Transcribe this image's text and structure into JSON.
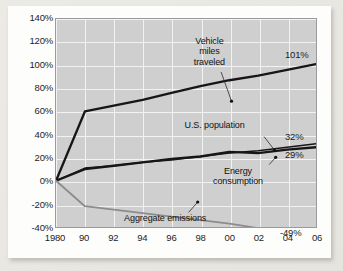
{
  "chart_data": {
    "type": "line",
    "title": "",
    "subtitle": "",
    "xlabel": "",
    "ylabel": "",
    "grid": true,
    "legend_position": "inline-annotations",
    "xlim": [
      1980,
      2006
    ],
    "ylim": [
      -40,
      140
    ],
    "ytick_step": 20,
    "x": [
      1980,
      1990,
      1992,
      1994,
      1996,
      1998,
      2000,
      2002,
      2004,
      2006
    ],
    "xtick_labels": [
      "1980",
      "90",
      "92",
      "94",
      "96",
      "98",
      "00",
      "02",
      "04",
      "06"
    ],
    "ytick_labels": [
      "140%",
      "120%",
      "100%",
      "80%",
      "60%",
      "40%",
      "20%",
      "0%",
      "-20%",
      "-40%"
    ],
    "ytick_values": [
      140,
      120,
      100,
      80,
      60,
      40,
      20,
      0,
      -20,
      -40
    ],
    "series": [
      {
        "name": "Vehicle miles traveled",
        "color": "#161616",
        "width": 2.3,
        "end_label": "101%",
        "end_value": 101,
        "values": [
          0,
          60,
          65,
          70,
          76,
          82,
          87,
          91,
          96,
          101
        ]
      },
      {
        "name": "U.S. population",
        "color": "#161616",
        "width": 1.4,
        "end_label": "32%",
        "end_value": 32,
        "values": [
          0,
          11,
          13,
          16,
          18,
          21,
          24,
          26,
          29,
          32
        ]
      },
      {
        "name": "Energy consumption",
        "color": "#161616",
        "width": 2.3,
        "end_label": "29%",
        "end_value": 29,
        "values": [
          0,
          10,
          13,
          16,
          19,
          21,
          25,
          24,
          27,
          29
        ]
      },
      {
        "name": "Aggregate emissions",
        "color": "#8c8c8c",
        "width": 1.8,
        "end_label": "-49%",
        "end_value": -49,
        "values": [
          0,
          -22,
          -25,
          -28,
          -31,
          -34,
          -37,
          -41,
          -45,
          -49
        ]
      }
    ],
    "annotations": [
      {
        "id": "vehicle-miles-traveled",
        "text": "Vehicle\nmiles\ntraveled",
        "lines": [
          "Vehicle",
          "miles",
          "traveled"
        ],
        "x_pct": 59.0,
        "y_pct": 8.0,
        "leader_from": [
          63.5,
          25.5
        ],
        "leader_to": [
          67.5,
          39.5
        ]
      },
      {
        "id": "us-population",
        "text": "U.S. population",
        "lines": [
          "U.S. population"
        ],
        "x_pct": 61.0,
        "y_pct": 48.5,
        "leader_from": [
          80.0,
          56.5
        ],
        "leader_to": [
          84.0,
          63.0
        ]
      },
      {
        "id": "energy-consumption",
        "text": "Energy\nconsumption",
        "lines": [
          "Energy",
          "consumption"
        ],
        "x_pct": 70.0,
        "y_pct": 70.5,
        "leader_from": [
          82.0,
          70.0
        ],
        "leader_to": [
          84.5,
          66.5
        ]
      },
      {
        "id": "aggregate-emissions",
        "text": "Aggregate emissions",
        "lines": [
          "Aggregate emissions"
        ],
        "x_pct": 42.0,
        "y_pct": 93.5,
        "leader_from": [
          51.0,
          93.0
        ],
        "leader_to": [
          54.5,
          88.0
        ]
      }
    ]
  },
  "colors": {
    "page_background": "#e8e6e1",
    "card_background": "#fdfdfc",
    "plot_background": "#cfcfcf",
    "gridline": "#f2f2f2",
    "axis_text": "#1d1d1d",
    "series_dark": "#161616",
    "series_gray": "#8c8c8c"
  }
}
